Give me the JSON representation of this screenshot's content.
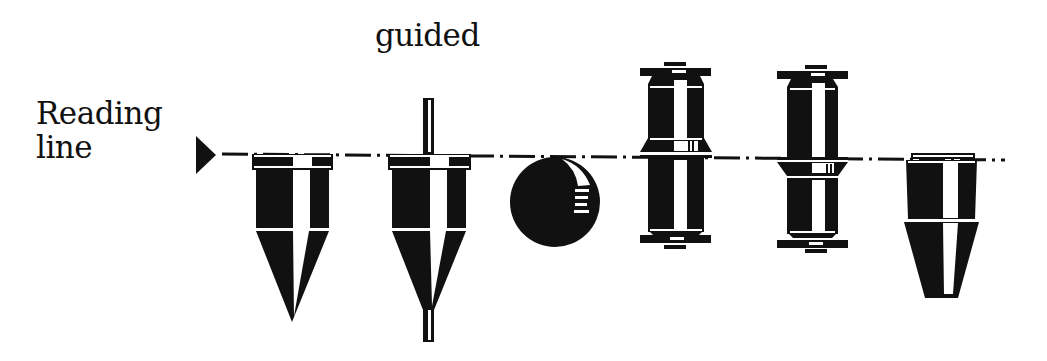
{
  "diagram": {
    "labels": {
      "reading_line_line1": "Reading",
      "reading_line_line2": "line",
      "guided": "guided"
    },
    "colors": {
      "ink": "#111111",
      "background": "#ffffff"
    },
    "objects": [
      {
        "id": "cone",
        "name": "pointed cone float"
      },
      {
        "id": "guided-cone",
        "name": "guided cone float with rod"
      },
      {
        "id": "sphere",
        "name": "spherical float"
      },
      {
        "id": "double-cylinder-1",
        "name": "guided spool float, collar above reading line"
      },
      {
        "id": "double-cylinder-2",
        "name": "guided spool float, collar below reading line"
      },
      {
        "id": "truncated-cone",
        "name": "truncated cone float"
      }
    ]
  }
}
